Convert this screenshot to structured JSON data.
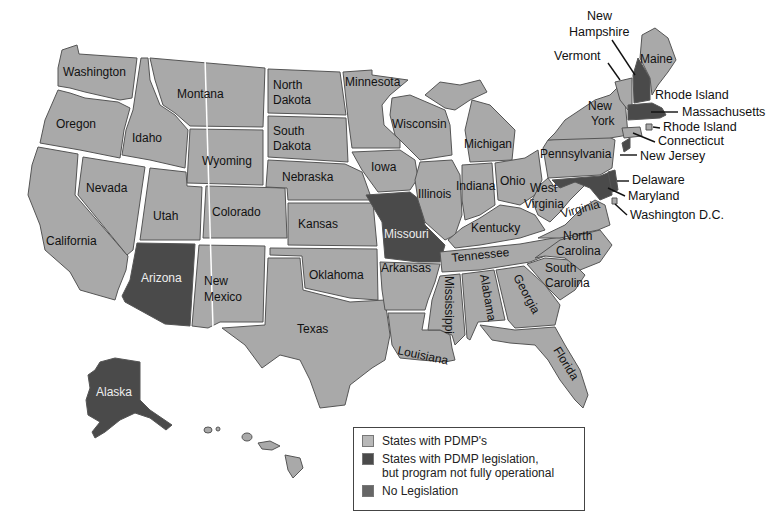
{
  "colors": {
    "pdmp": "#a9a9a9",
    "not_operational": "#4a4a4a",
    "no_legislation": "#666666",
    "border": "#ffffff",
    "outline": "#555555"
  },
  "legend": {
    "items": [
      {
        "label": "States with PDMP's",
        "category": "pdmp",
        "color": "#a9a9a9"
      },
      {
        "label": "States with PDMP legislation,",
        "label2": "but program not fully operational",
        "category": "not_operational",
        "color": "#4a4a4a"
      },
      {
        "label": "No Legislation",
        "category": "no_legislation",
        "color": "#666666"
      }
    ]
  },
  "states": {
    "washington": {
      "label": "Washington",
      "status": "pdmp"
    },
    "oregon": {
      "label": "Oregon",
      "status": "pdmp"
    },
    "california": {
      "label": "California",
      "status": "pdmp"
    },
    "idaho": {
      "label": "Idaho",
      "status": "pdmp"
    },
    "nevada": {
      "label": "Nevada",
      "status": "pdmp"
    },
    "montana": {
      "label": "Montana",
      "status": "pdmp"
    },
    "wyoming": {
      "label": "Wyoming",
      "status": "pdmp"
    },
    "utah": {
      "label": "Utah",
      "status": "pdmp"
    },
    "colorado": {
      "label": "Colorado",
      "status": "pdmp"
    },
    "arizona": {
      "label": "Arizona",
      "status": "not_operational"
    },
    "new_mexico": {
      "label1": "New",
      "label2": "Mexico",
      "status": "pdmp"
    },
    "north_dakota": {
      "label1": "North",
      "label2": "Dakota",
      "status": "pdmp"
    },
    "south_dakota": {
      "label1": "South",
      "label2": "Dakota",
      "status": "pdmp"
    },
    "nebraska": {
      "label": "Nebraska",
      "status": "pdmp"
    },
    "kansas": {
      "label": "Kansas",
      "status": "pdmp"
    },
    "oklahoma": {
      "label": "Oklahoma",
      "status": "pdmp"
    },
    "texas": {
      "label": "Texas",
      "status": "pdmp"
    },
    "minnesota": {
      "label": "Minnesota",
      "status": "pdmp"
    },
    "iowa": {
      "label": "Iowa",
      "status": "pdmp"
    },
    "missouri": {
      "label": "Missouri",
      "status": "not_operational"
    },
    "arkansas": {
      "label": "Arkansas",
      "status": "pdmp"
    },
    "louisiana": {
      "label": "Louisiana",
      "status": "pdmp"
    },
    "wisconsin": {
      "label": "Wisconsin",
      "status": "pdmp"
    },
    "illinois": {
      "label": "Illinois",
      "status": "pdmp"
    },
    "michigan": {
      "label": "Michigan",
      "status": "pdmp"
    },
    "indiana": {
      "label": "Indiana",
      "status": "pdmp"
    },
    "ohio": {
      "label": "Ohio",
      "status": "pdmp"
    },
    "kentucky": {
      "label": "Kentucky",
      "status": "pdmp"
    },
    "tennessee": {
      "label": "Tennessee",
      "status": "pdmp"
    },
    "mississippi": {
      "label": "Mississippi",
      "status": "pdmp"
    },
    "alabama": {
      "label": "Alabama",
      "status": "pdmp"
    },
    "georgia": {
      "label": "Georgia",
      "status": "pdmp"
    },
    "florida": {
      "label": "Florida",
      "status": "pdmp"
    },
    "south_carolina": {
      "label1": "South",
      "label2": "Carolina",
      "status": "pdmp"
    },
    "north_carolina": {
      "label1": "North",
      "label2": "Carolina",
      "status": "pdmp"
    },
    "virginia": {
      "label": "Virginia",
      "status": "pdmp"
    },
    "west_virginia": {
      "label1": "West",
      "label2": "Virginia",
      "status": "pdmp"
    },
    "pennsylvania": {
      "label": "Pennsylvania",
      "status": "no_legislation"
    },
    "new_york": {
      "label1": "New",
      "label2": "York",
      "status": "pdmp"
    },
    "vermont": {
      "label": "Vermont",
      "status": "pdmp"
    },
    "new_hampshire": {
      "label1": "New",
      "label2": "Hampshire",
      "status": "not_operational"
    },
    "maine": {
      "label": "Maine",
      "status": "pdmp"
    },
    "massachusetts": {
      "label": "Massachusetts",
      "status": "not_operational"
    },
    "rhode_island": {
      "label": "Rhode Island",
      "status": "pdmp"
    },
    "connecticut": {
      "label": "Connecticut",
      "status": "pdmp"
    },
    "new_jersey": {
      "label": "New Jersey",
      "status": "not_operational"
    },
    "delaware": {
      "label": "Delaware",
      "status": "not_operational"
    },
    "maryland": {
      "label": "Maryland",
      "status": "not_operational"
    },
    "washington_dc": {
      "label": "Washington D.C.",
      "status": "pdmp"
    },
    "alaska": {
      "label": "Alaska",
      "status": "not_operational"
    },
    "hawaii": {
      "label": "",
      "status": "pdmp"
    }
  },
  "callouts": {
    "rhode_island_upper": "Rhode Island",
    "rhode_island_lower": "Rhode Island"
  }
}
